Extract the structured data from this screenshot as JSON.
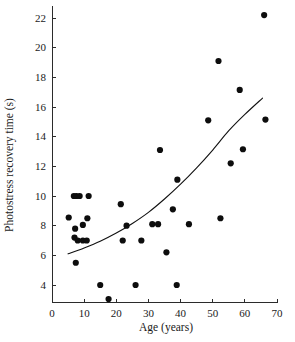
{
  "chart_data": {
    "type": "scatter",
    "title": "",
    "xlabel": "Age (years)",
    "ylabel": "Photostress recovery time (s)",
    "xlim": [
      0,
      70
    ],
    "ylim": [
      2.8,
      22.8
    ],
    "xticks": [
      0,
      10,
      20,
      30,
      40,
      50,
      60,
      70
    ],
    "xtick_labels": [
      "0",
      "10",
      "20",
      "30",
      "40",
      "50",
      "60",
      "70"
    ],
    "yticks": [
      4,
      6,
      8,
      10,
      12,
      14,
      16,
      18,
      20,
      22
    ],
    "ytick_labels": [
      "4",
      "6",
      "8",
      "10",
      "12",
      "14",
      "16",
      "18",
      "20",
      "22"
    ],
    "grid": false,
    "legend": null,
    "marker": "filled-circle",
    "marker_color": "#0d0d0d",
    "marker_size": 3.1,
    "points": [
      {
        "x": 5.2,
        "y": 8.55
      },
      {
        "x": 6.8,
        "y": 10.0
      },
      {
        "x": 7.6,
        "y": 10.0
      },
      {
        "x": 8.6,
        "y": 10.0
      },
      {
        "x": 11.4,
        "y": 10.0
      },
      {
        "x": 7.2,
        "y": 7.8
      },
      {
        "x": 7.0,
        "y": 7.2
      },
      {
        "x": 9.6,
        "y": 8.05
      },
      {
        "x": 11.0,
        "y": 8.5
      },
      {
        "x": 8.0,
        "y": 7.0
      },
      {
        "x": 9.6,
        "y": 7.0
      },
      {
        "x": 10.8,
        "y": 7.0
      },
      {
        "x": 7.4,
        "y": 5.5
      },
      {
        "x": 15.0,
        "y": 4.0
      },
      {
        "x": 17.6,
        "y": 3.05
      },
      {
        "x": 21.4,
        "y": 9.45
      },
      {
        "x": 22.0,
        "y": 7.0
      },
      {
        "x": 23.2,
        "y": 8.0
      },
      {
        "x": 26.0,
        "y": 4.0
      },
      {
        "x": 27.8,
        "y": 7.0
      },
      {
        "x": 31.2,
        "y": 8.1
      },
      {
        "x": 33.0,
        "y": 8.1
      },
      {
        "x": 33.6,
        "y": 13.1
      },
      {
        "x": 35.6,
        "y": 6.2
      },
      {
        "x": 37.6,
        "y": 9.1
      },
      {
        "x": 38.8,
        "y": 4.0
      },
      {
        "x": 39.0,
        "y": 11.1
      },
      {
        "x": 42.6,
        "y": 8.1
      },
      {
        "x": 48.6,
        "y": 15.1
      },
      {
        "x": 51.8,
        "y": 19.1
      },
      {
        "x": 52.4,
        "y": 8.5
      },
      {
        "x": 55.6,
        "y": 12.2
      },
      {
        "x": 58.4,
        "y": 17.15
      },
      {
        "x": 59.4,
        "y": 13.15
      },
      {
        "x": 66.0,
        "y": 22.2
      },
      {
        "x": 66.4,
        "y": 15.15
      }
    ],
    "fit_curve": {
      "description": "exponential fitted trend line",
      "x_start": 5.0,
      "x_end": 65.5,
      "y_start": 6.1,
      "y_end": 16.6,
      "points": [
        {
          "x": 5.0,
          "y": 6.1
        },
        {
          "x": 10.0,
          "y": 6.5
        },
        {
          "x": 15.0,
          "y": 6.95
        },
        {
          "x": 20.0,
          "y": 7.5
        },
        {
          "x": 25.0,
          "y": 8.15
        },
        {
          "x": 30.0,
          "y": 8.9
        },
        {
          "x": 35.0,
          "y": 9.8
        },
        {
          "x": 40.0,
          "y": 10.8
        },
        {
          "x": 45.0,
          "y": 11.9
        },
        {
          "x": 50.0,
          "y": 13.1
        },
        {
          "x": 55.0,
          "y": 14.4
        },
        {
          "x": 60.0,
          "y": 15.5
        },
        {
          "x": 65.5,
          "y": 16.6
        }
      ]
    }
  },
  "colors": {
    "background": "#ffffff",
    "axis": "#2b2b2b",
    "marker": "#0d0d0d",
    "curve": "#111111",
    "text": "#1a1a1a"
  }
}
